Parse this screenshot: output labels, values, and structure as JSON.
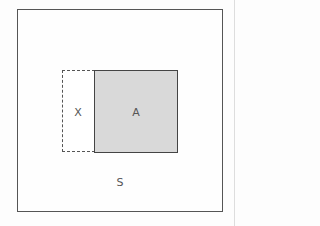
{
  "diagram": {
    "outer_label": "S",
    "region_x_label": "X",
    "region_a_label": "A",
    "colors": {
      "region_a_fill": "#d9d9d9",
      "border": "#555555"
    }
  }
}
